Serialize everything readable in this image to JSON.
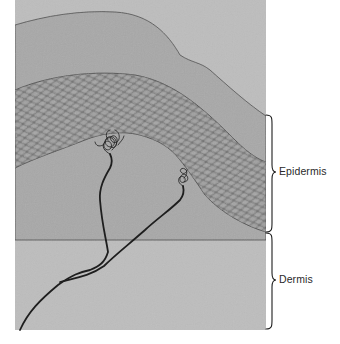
{
  "diagram": {
    "labels": {
      "epidermis": "Epidermis",
      "dermis": "Dermis"
    },
    "colors": {
      "stratum_corneum": "#a9a9a9",
      "cell_layer": "#9a9a9a",
      "cell_outline": "#5a5a5a",
      "dermis": "#bdbdbd",
      "nerve": "#1e1e1e",
      "brace": "#1e1e1e",
      "background": "#ffffff"
    },
    "regions": [
      {
        "name": "stratum-corneum",
        "desc": "outer flat grey layer"
      },
      {
        "name": "cellular-epidermis",
        "desc": "layer of packed oval cells"
      },
      {
        "name": "dermis",
        "desc": "lighter grey lower tissue"
      }
    ],
    "nerve_endings": [
      {
        "name": "free-nerve-ending-left",
        "x": 110,
        "y": 150
      },
      {
        "name": "free-nerve-ending-right",
        "x": 183,
        "y": 180
      }
    ]
  }
}
